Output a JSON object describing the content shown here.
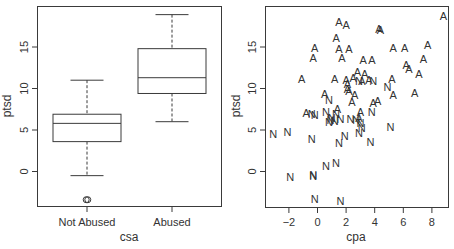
{
  "chart_data": [
    {
      "type": "box",
      "title": "",
      "xlabel": "csa",
      "ylabel": "ptsd",
      "categories": [
        "Not Abused",
        "Abused"
      ],
      "yticks": [
        0,
        5,
        10,
        15
      ],
      "ylim": [
        -4.2,
        19.8
      ],
      "grid": false,
      "boxes": [
        {
          "label": "Not Abused",
          "whisker_low": -0.5,
          "q1": 3.6,
          "median": 5.8,
          "q3": 6.9,
          "whisker_high": 11.0,
          "outliers": [
            -3.4
          ]
        },
        {
          "label": "Abused",
          "whisker_low": 6.0,
          "q1": 9.4,
          "median": 11.3,
          "q3": 14.8,
          "whisker_high": 18.9,
          "outliers": []
        }
      ]
    },
    {
      "type": "scatter",
      "title": "",
      "xlabel": "cpa",
      "ylabel": "ptsd",
      "xticks": [
        -2,
        0,
        2,
        4,
        6,
        8
      ],
      "yticks": [
        0,
        5,
        10,
        15
      ],
      "xlim": [
        -3.6,
        9.2
      ],
      "ylim": [
        -4.2,
        19.8
      ],
      "grid": false,
      "marker_legend": {
        "A": "Abused",
        "N": "Not Abused"
      },
      "series": [
        {
          "name": "A",
          "points": [
            [
              1.5,
              18.0
            ],
            [
              2.0,
              17.6
            ],
            [
              1.3,
              16.1
            ],
            [
              1.5,
              14.7
            ],
            [
              2.2,
              14.8
            ],
            [
              1.7,
              13.7
            ],
            [
              -0.2,
              14.9
            ],
            [
              -0.3,
              13.7
            ],
            [
              -1.1,
              11.2
            ],
            [
              1.2,
              11.1
            ],
            [
              4.3,
              17.2
            ],
            [
              4.4,
              17.0
            ],
            [
              8.8,
              18.7
            ],
            [
              5.3,
              14.9
            ],
            [
              6.1,
              14.9
            ],
            [
              7.7,
              15.2
            ],
            [
              7.4,
              13.6
            ],
            [
              6.2,
              12.8
            ],
            [
              6.4,
              12.4
            ],
            [
              7.1,
              11.7
            ],
            [
              6.8,
              9.5
            ],
            [
              5.2,
              11.1
            ],
            [
              5.3,
              9.2
            ],
            [
              3.2,
              13.4
            ],
            [
              3.8,
              13.4
            ],
            [
              2.8,
              12.0
            ],
            [
              3.3,
              11.7
            ],
            [
              2.5,
              11.3
            ],
            [
              2.0,
              11.0
            ],
            [
              2.1,
              10.5
            ],
            [
              2.1,
              10.0
            ],
            [
              2.2,
              9.7
            ],
            [
              2.6,
              9.2
            ],
            [
              2.4,
              8.4
            ],
            [
              3.1,
              10.9
            ],
            [
              3.6,
              11.0
            ],
            [
              3.9,
              8.3
            ],
            [
              4.2,
              8.5
            ],
            [
              0.5,
              9.3
            ],
            [
              1.4,
              7.5
            ],
            [
              -0.8,
              7.0
            ],
            [
              3.0,
              7.2
            ],
            [
              2.9,
              6.5
            ]
          ]
        },
        {
          "name": "N",
          "points": [
            [
              -3.1,
              4.5
            ],
            [
              -2.1,
              4.7
            ],
            [
              -0.4,
              3.9
            ],
            [
              1.5,
              3.4
            ],
            [
              1.9,
              4.3
            ],
            [
              2.9,
              4.6
            ],
            [
              3.7,
              3.5
            ],
            [
              -1.9,
              -0.7
            ],
            [
              -0.3,
              -0.5
            ],
            [
              -0.3,
              -0.4
            ],
            [
              0.6,
              0.7
            ],
            [
              1.3,
              1.0
            ],
            [
              -0.2,
              -3.3
            ],
            [
              1.6,
              -3.5
            ],
            [
              4.9,
              10.2
            ],
            [
              5.1,
              5.4
            ],
            [
              3.9,
              10.9
            ],
            [
              2.9,
              10.9
            ],
            [
              0.8,
              8.6
            ],
            [
              0.6,
              7.2
            ],
            [
              -0.4,
              6.9
            ],
            [
              -0.2,
              6.8
            ],
            [
              0.9,
              6.2
            ],
            [
              1.0,
              6.5
            ],
            [
              1.2,
              6.1
            ],
            [
              1.6,
              6.3
            ],
            [
              2.3,
              6.3
            ],
            [
              2.7,
              6.2
            ],
            [
              3.0,
              5.8
            ],
            [
              3.1,
              5.2
            ],
            [
              3.8,
              7.2
            ],
            [
              1.3,
              6.9
            ],
            [
              0.8,
              6.0
            ]
          ]
        }
      ]
    }
  ]
}
